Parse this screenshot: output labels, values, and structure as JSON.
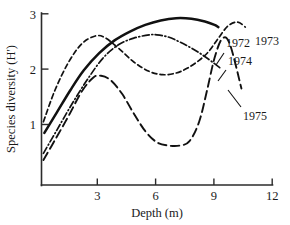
{
  "chart_data": {
    "type": "line",
    "title": "",
    "xlabel": "Depth (m)",
    "ylabel": "Species diversity (H')",
    "xlim": [
      0,
      12
    ],
    "ylim": [
      0,
      3
    ],
    "xticks": [
      3,
      6,
      9,
      12
    ],
    "yticks": [
      1,
      2,
      3
    ],
    "xtick_labels": [
      "3",
      "6",
      "9",
      "12"
    ],
    "ytick_labels": [
      "1",
      "2",
      "3"
    ],
    "grid": false,
    "legend": "inline-annotations",
    "series": [
      {
        "name": "1972",
        "style": "solid",
        "label": "1972",
        "x": [
          0.15,
          0.8,
          1.5,
          2.2,
          3.0,
          3.8,
          4.6,
          5.4,
          6.2,
          7.0,
          7.8,
          8.5,
          9.0,
          9.2
        ],
        "y": [
          0.85,
          1.22,
          1.62,
          1.98,
          2.29,
          2.52,
          2.68,
          2.8,
          2.88,
          2.92,
          2.91,
          2.86,
          2.8,
          2.76
        ]
      },
      {
        "name": "1973",
        "style": "dashed-short",
        "label": "1973",
        "x": [
          0.1,
          0.7,
          1.4,
          2.1,
          2.8,
          3.3,
          4.0,
          4.8,
          5.6,
          6.3,
          7.0,
          7.6,
          8.2,
          8.7,
          9.2,
          9.7,
          10.2,
          10.6
        ],
        "y": [
          1.05,
          1.62,
          2.12,
          2.46,
          2.6,
          2.57,
          2.38,
          2.13,
          1.96,
          1.9,
          1.93,
          2.02,
          2.16,
          2.32,
          2.56,
          2.78,
          2.85,
          2.76
        ]
      },
      {
        "name": "1974",
        "style": "dash-dot",
        "label": "1974",
        "x": [
          0.1,
          0.8,
          1.6,
          2.4,
          3.2,
          4.0,
          4.8,
          5.6,
          6.0,
          6.6,
          7.2,
          7.8,
          8.4,
          9.0,
          9.3
        ],
        "y": [
          0.48,
          0.9,
          1.38,
          1.82,
          2.2,
          2.44,
          2.56,
          2.62,
          2.62,
          2.58,
          2.49,
          2.38,
          2.25,
          2.1,
          2.02
        ]
      },
      {
        "name": "1975",
        "style": "dashed-long",
        "label": "1975",
        "x": [
          0.1,
          0.7,
          1.4,
          2.1,
          2.7,
          3.1,
          3.6,
          4.2,
          4.8,
          5.4,
          6.0,
          6.6,
          7.2,
          7.7,
          8.2,
          8.6,
          9.0,
          9.4,
          9.8,
          10.4
        ],
        "y": [
          0.36,
          0.72,
          1.15,
          1.6,
          1.85,
          1.88,
          1.8,
          1.55,
          1.2,
          0.88,
          0.68,
          0.62,
          0.62,
          0.7,
          1.05,
          1.6,
          2.2,
          2.55,
          2.45,
          1.65
        ]
      }
    ],
    "annotations": [
      {
        "text": "1972",
        "x": 9.6,
        "y": 2.73
      },
      {
        "text": "1973",
        "x": 11.0,
        "y": 2.76
      },
      {
        "text": "1974",
        "x": 9.9,
        "y": 2.44
      },
      {
        "text": "1975",
        "x": 11.0,
        "y": 1.28
      }
    ]
  }
}
